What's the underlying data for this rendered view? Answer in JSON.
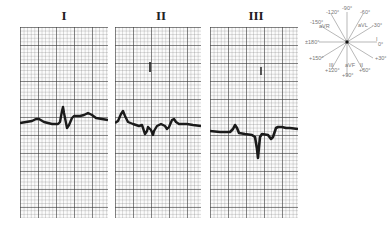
{
  "leads": [
    {
      "label": "I"
    },
    {
      "label": "II"
    },
    {
      "label": "III"
    }
  ],
  "hexaxial": {
    "center_label": "",
    "angles": [
      "-90°",
      "-60°",
      "-30°",
      "0°",
      "+30°",
      "+60°",
      "+90°",
      "+120°",
      "+150°",
      "±180°",
      "-150°",
      "-120°"
    ],
    "leads": [
      "aVR",
      "aVL",
      "I",
      "II",
      "aVF",
      "III"
    ],
    "labels": {
      "top": "-90°",
      "top_right": "-60°",
      "avl": "aVL",
      "right_upper": "-30°",
      "lead_i": "I",
      "right": "0°",
      "right_lower": "+30°",
      "lead_ii": "II",
      "bottom_right": "+60°",
      "avf": "aVF",
      "bottom": "+90°",
      "lead_iii": "III",
      "bottom_left": "+120°",
      "left_lower": "+150°",
      "left": "±180°",
      "avr": "aVR",
      "left_upper": "-150°",
      "top_left": "-120°"
    }
  },
  "colors": {
    "trace": "#1a1a1a",
    "grid_major": "#555555",
    "grid_minor": "#aaaaaa",
    "paper": "#fbfbfb"
  }
}
